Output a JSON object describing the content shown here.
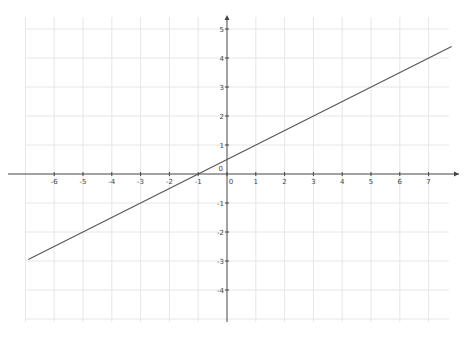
{
  "chart_data": {
    "type": "line",
    "title": "",
    "xlabel": "",
    "ylabel": "",
    "xlim": [
      -6.9,
      7.8
    ],
    "ylim": [
      -5.1,
      5.4
    ],
    "grid": true,
    "x_ticks": [
      "-6",
      "-5",
      "-4",
      "-3",
      "-2",
      "-1",
      "0",
      "1",
      "2",
      "3",
      "4",
      "5",
      "6",
      "7"
    ],
    "y_ticks": [
      "-4",
      "-3",
      "-2",
      "-1",
      "0",
      "1",
      "2",
      "3",
      "4",
      "5"
    ],
    "origin_label": "0",
    "series": [
      {
        "name": "line",
        "equation": "y = 0.5x + 0.5",
        "x": [
          -6.9,
          7.8
        ],
        "y": [
          -2.95,
          4.4
        ],
        "color": "#555555"
      }
    ]
  },
  "view": {
    "width": 470,
    "height": 341,
    "origin_px": [
      227,
      174
    ],
    "unit_x": 28.8,
    "unit_y": 29.0,
    "grid_left": 25,
    "grid_right": 449,
    "grid_top": 17,
    "grid_bottom": 322,
    "grid_color": "#e6e6e6",
    "axis_color": "#444444"
  }
}
